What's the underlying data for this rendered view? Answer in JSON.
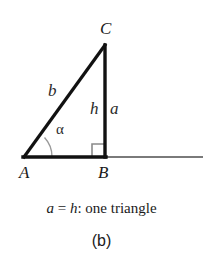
{
  "figure": {
    "caption_parts": {
      "side_a": "a",
      "equals": " = ",
      "height_h": "h",
      "rest": ": one triangle"
    },
    "subcaption": "(b)"
  },
  "diagram": {
    "type": "geometry-right-triangle",
    "vertices": {
      "A": {
        "label": "A",
        "x": 24,
        "y": 157
      },
      "B": {
        "label": "B",
        "x": 105,
        "y": 157
      },
      "C": {
        "label": "C",
        "x": 105,
        "y": 45
      }
    },
    "side_labels": {
      "b": "b",
      "h": "h",
      "a": "a"
    },
    "angle_label": "α",
    "marks": {
      "right_angle_at": "B",
      "angle_arc_at": "A"
    },
    "ray": {
      "from_x": 105,
      "to_x": 203,
      "y": 157
    },
    "colors": {
      "triangle_stroke": "#111111",
      "ray_stroke": "#7a7a7a",
      "mark_stroke": "#8a8a8a",
      "text": "#1a1a1a",
      "background": "#ffffff"
    }
  }
}
